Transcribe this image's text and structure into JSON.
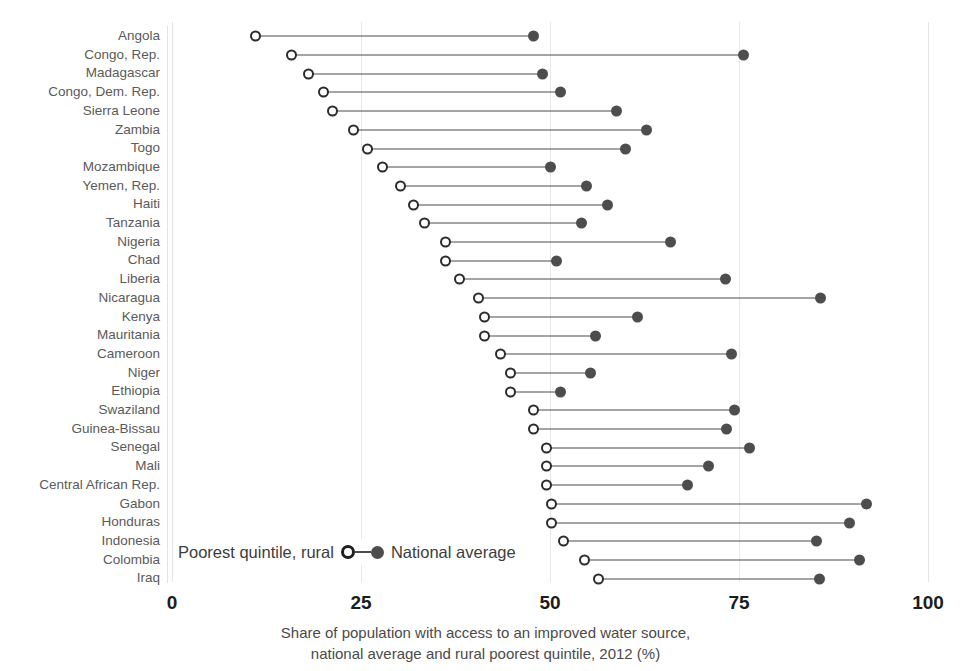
{
  "chart_data": {
    "type": "dumbbell",
    "title": "",
    "xlabel_lines": [
      "Share of population with access to an improved water source,",
      "national average and rural poorest quintile, 2012 (%)"
    ],
    "ylabel": "",
    "xlim": [
      0,
      100
    ],
    "xticks": [
      0,
      25,
      50,
      75,
      100
    ],
    "xtick_labels": [
      "0",
      "25",
      "50",
      "75",
      "100"
    ],
    "grid": true,
    "grid_axis": "x",
    "legend": {
      "position": "bottom-left-inside",
      "left_label": "Poorest quintile, rural",
      "right_label": "National average",
      "series_open": "Poorest quintile, rural",
      "series_filled": "National average"
    },
    "series": [
      {
        "name": "Poorest quintile, rural",
        "marker": "open-circle",
        "color": "#2b2b2b"
      },
      {
        "name": "National average",
        "marker": "filled-circle",
        "color": "#4d4d4d"
      }
    ],
    "categories": [
      "Angola",
      "Congo, Rep.",
      "Madagascar",
      "Congo, Dem. Rep.",
      "Sierra Leone",
      "Zambia",
      "Togo",
      "Mozambique",
      "Yemen, Rep.",
      "Haiti",
      "Tanzania",
      "Nigeria",
      "Chad",
      "Liberia",
      "Nicaragua",
      "Kenya",
      "Mauritania",
      "Cameroon",
      "Niger",
      "Ethiopia",
      "Swaziland",
      "Guinea-Bissau",
      "Senegal",
      "Mali",
      "Central African Rep.",
      "Gabon",
      "Honduras",
      "Indonesia",
      "Colombia",
      "Iraq"
    ],
    "rows": [
      {
        "category": "Angola",
        "poorest_rural": 11.0,
        "national_average": 47.8
      },
      {
        "category": "Congo, Rep.",
        "poorest_rural": 15.8,
        "national_average": 75.6
      },
      {
        "category": "Madagascar",
        "poorest_rural": 18.0,
        "national_average": 49.0
      },
      {
        "category": "Congo, Dem. Rep.",
        "poorest_rural": 20.0,
        "national_average": 51.4
      },
      {
        "category": "Sierra Leone",
        "poorest_rural": 21.2,
        "national_average": 58.8
      },
      {
        "category": "Zambia",
        "poorest_rural": 24.0,
        "national_average": 62.8
      },
      {
        "category": "Togo",
        "poorest_rural": 25.8,
        "national_average": 60.0
      },
      {
        "category": "Mozambique",
        "poorest_rural": 27.8,
        "national_average": 50.0
      },
      {
        "category": "Yemen, Rep.",
        "poorest_rural": 30.2,
        "national_average": 54.8
      },
      {
        "category": "Haiti",
        "poorest_rural": 32.0,
        "national_average": 57.6
      },
      {
        "category": "Tanzania",
        "poorest_rural": 33.4,
        "national_average": 54.2
      },
      {
        "category": "Nigeria",
        "poorest_rural": 36.2,
        "national_average": 66.0
      },
      {
        "category": "Chad",
        "poorest_rural": 36.2,
        "national_average": 50.8
      },
      {
        "category": "Liberia",
        "poorest_rural": 38.0,
        "national_average": 73.2
      },
      {
        "category": "Nicaragua",
        "poorest_rural": 40.6,
        "national_average": 85.8
      },
      {
        "category": "Kenya",
        "poorest_rural": 41.4,
        "national_average": 61.6
      },
      {
        "category": "Mauritania",
        "poorest_rural": 41.4,
        "national_average": 56.0
      },
      {
        "category": "Cameroon",
        "poorest_rural": 43.4,
        "national_average": 74.0
      },
      {
        "category": "Niger",
        "poorest_rural": 44.8,
        "national_average": 55.4
      },
      {
        "category": "Ethiopia",
        "poorest_rural": 44.8,
        "national_average": 51.4
      },
      {
        "category": "Swaziland",
        "poorest_rural": 47.8,
        "national_average": 74.4
      },
      {
        "category": "Guinea-Bissau",
        "poorest_rural": 47.8,
        "national_average": 73.4
      },
      {
        "category": "Senegal",
        "poorest_rural": 49.6,
        "national_average": 76.4
      },
      {
        "category": "Mali",
        "poorest_rural": 49.6,
        "national_average": 71.0
      },
      {
        "category": "Central African Rep.",
        "poorest_rural": 49.6,
        "national_average": 68.2
      },
      {
        "category": "Gabon",
        "poorest_rural": 50.2,
        "national_average": 91.8
      },
      {
        "category": "Honduras",
        "poorest_rural": 50.2,
        "national_average": 89.6
      },
      {
        "category": "Indonesia",
        "poorest_rural": 51.8,
        "national_average": 85.2
      },
      {
        "category": "Colombia",
        "poorest_rural": 54.6,
        "national_average": 91.0
      },
      {
        "category": "Iraq",
        "poorest_rural": 56.4,
        "national_average": 85.6
      }
    ]
  },
  "colors": {
    "open_marker": "#2b2b2b",
    "filled_marker": "#4d4d4d",
    "connector": "#4a4a4a",
    "gridline": "#e8e8e8",
    "label_text": "#5a5a5a",
    "tick_text": "#1c1c1c",
    "caption_text": "#4a4a4a",
    "background": "#ffffff"
  }
}
